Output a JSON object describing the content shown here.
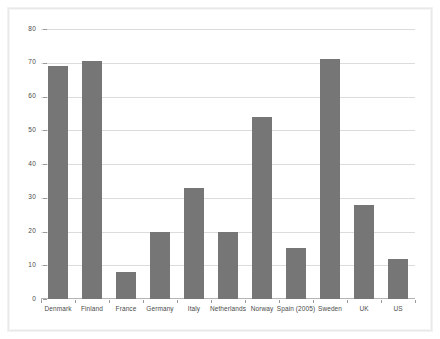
{
  "chart_data": {
    "type": "bar",
    "title": "",
    "subtitle": "",
    "xlabel": "",
    "ylabel": "",
    "ylim": [
      0,
      80
    ],
    "yticks": [
      0,
      10,
      20,
      30,
      40,
      50,
      60,
      70,
      80
    ],
    "grid": true,
    "legend": false,
    "legend_position": "none",
    "categories": [
      "Denmark",
      "Finland",
      "France",
      "Germany",
      "Italy",
      "Netherlands",
      "Norway",
      "Spain (2005)",
      "Sweden",
      "UK",
      "US"
    ],
    "values": [
      69,
      70.5,
      8,
      20,
      33,
      20,
      54,
      15,
      71,
      28,
      12
    ],
    "series": [
      {
        "name": "",
        "values": [
          69,
          70.5,
          8,
          20,
          33,
          20,
          54,
          15,
          71,
          28,
          12
        ]
      }
    ],
    "colors": {
      "bar": "#767676",
      "gridline": "#dcdcdc",
      "axis": "#b4b4b4",
      "tick_label": "#4a4a4a",
      "plot_background": "#ffffff",
      "figure_background": "#ffffff",
      "frame_border": "#e9e9e9"
    }
  }
}
